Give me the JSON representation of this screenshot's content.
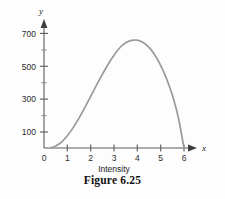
{
  "figure": {
    "caption": "Figure 6.25"
  },
  "axes": {
    "y_axis_name": "y",
    "x_axis_name": "x",
    "x_title": "Intensity",
    "y_major_labels": [
      "700",
      "500",
      "300",
      "100"
    ],
    "x_labels": [
      "0",
      "1",
      "2",
      "3",
      "4",
      "5",
      "6"
    ]
  },
  "colors": {
    "curve": "#9a9a9a",
    "axis": "#5a5a5a",
    "text": "#1a1a1a",
    "background": "#fdfdfd"
  },
  "chart_data": {
    "type": "line",
    "title": "Figure 6.25",
    "xlabel": "Intensity",
    "ylabel": "y",
    "grid": false,
    "legend": null,
    "xlim": [
      0,
      6.4
    ],
    "ylim": [
      0,
      760
    ],
    "xticks": [
      0,
      1,
      2,
      3,
      4,
      5,
      6
    ],
    "xtick_labels": [
      "0",
      "1",
      "2",
      "3",
      "4",
      "5",
      "6"
    ],
    "yticks": [
      100,
      200,
      300,
      400,
      500,
      600,
      700
    ],
    "ytick_labels": [
      "100",
      "",
      "300",
      "",
      "500",
      "",
      "700"
    ],
    "ytick_major": [
      100,
      300,
      500,
      700
    ],
    "ytick_minor": [
      200,
      400,
      600
    ],
    "series": [
      {
        "name": "intensity-curve",
        "x": [
          0.3,
          0.5,
          0.75,
          1.0,
          1.25,
          1.5,
          1.75,
          2.0,
          2.25,
          2.5,
          2.75,
          3.0,
          3.25,
          3.5,
          3.75,
          4.0,
          4.25,
          4.5,
          4.75,
          5.0,
          5.25,
          5.5,
          5.75,
          6.0
        ],
        "y": [
          0,
          12,
          36,
          74,
          124,
          182,
          246,
          314,
          382,
          448,
          510,
          565,
          610,
          640,
          655,
          656,
          642,
          612,
          566,
          503,
          422,
          322,
          190,
          0
        ]
      }
    ],
    "annotations": {
      "peak_x": 4.0,
      "peak_y": 656,
      "root_left": 0.3,
      "root_right": 6.0
    }
  }
}
